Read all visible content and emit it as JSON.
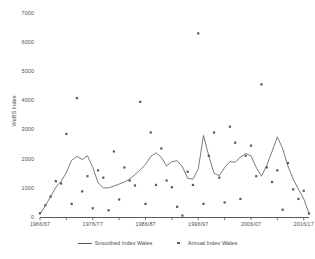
{
  "chart_data": {
    "type": "line",
    "title": "",
    "xlabel": "",
    "ylabel": "WeBS Index",
    "ylim": [
      0,
      7000
    ],
    "grid": false,
    "legend_position": "bottom",
    "y_ticks": [
      "0",
      "1000",
      "2000",
      "3000",
      "4000",
      "5000",
      "6000",
      "7000"
    ],
    "y_tick_values": [
      0,
      1000,
      2000,
      3000,
      4000,
      5000,
      6000,
      7000
    ],
    "x_ticks": [
      "1966/67",
      "1976/77",
      "1986/87",
      "1996/97",
      "2006/07",
      "2016/17"
    ],
    "x_tick_values": [
      1966,
      1976,
      1986,
      1996,
      2006,
      2016
    ],
    "x_range": [
      1966,
      2017
    ],
    "series": [
      {
        "name": "Smoothed Index Wales",
        "type": "line",
        "x": [
          1966,
          1967,
          1968,
          1969,
          1970,
          1971,
          1972,
          1973,
          1974,
          1975,
          1976,
          1977,
          1978,
          1979,
          1980,
          1981,
          1982,
          1983,
          1984,
          1985,
          1986,
          1987,
          1988,
          1989,
          1990,
          1991,
          1992,
          1993,
          1994,
          1995,
          1996,
          1997,
          1998,
          1999,
          2000,
          2001,
          2002,
          2003,
          2004,
          2005,
          2006,
          2007,
          2008,
          2009,
          2010,
          2011,
          2012,
          2013,
          2014,
          2015,
          2016,
          2017
        ],
        "values": [
          100,
          380,
          700,
          1020,
          1230,
          1520,
          1950,
          2080,
          1970,
          2100,
          1700,
          1180,
          1000,
          1000,
          1060,
          1130,
          1200,
          1300,
          1450,
          1620,
          1800,
          2080,
          2200,
          2050,
          1750,
          1900,
          1930,
          1720,
          1330,
          1300,
          1650,
          2800,
          2100,
          1500,
          1420,
          1700,
          1900,
          1880,
          2050,
          2180,
          2100,
          1700,
          1400,
          1780,
          2250,
          2750,
          2350,
          1750,
          1300,
          950,
          620,
          120
        ]
      },
      {
        "name": "Annual Index Wales",
        "type": "scatter",
        "x": [
          1966,
          1967,
          1968,
          1969,
          1970,
          1971,
          1972,
          1973,
          1974,
          1975,
          1976,
          1977,
          1978,
          1979,
          1980,
          1981,
          1982,
          1983,
          1984,
          1985,
          1986,
          1987,
          1988,
          1989,
          1990,
          1991,
          1992,
          1993,
          1994,
          1995,
          1996,
          1997,
          1998,
          1999,
          2000,
          2001,
          2002,
          2003,
          2004,
          2005,
          2006,
          2007,
          2008,
          2009,
          2010,
          2011,
          2012,
          2013,
          2014,
          2015,
          2016,
          2017
        ],
        "values": [
          130,
          400,
          700,
          1230,
          1150,
          2850,
          450,
          4080,
          880,
          1400,
          300,
          1600,
          1350,
          230,
          2250,
          600,
          1700,
          1250,
          1080,
          3950,
          450,
          2900,
          1100,
          2350,
          1250,
          1020,
          350,
          50,
          1550,
          1100,
          6300,
          450,
          2100,
          2900,
          1350,
          500,
          3100,
          2550,
          620,
          2100,
          2450,
          1400,
          4550,
          1700,
          1200,
          1600,
          250,
          1850,
          950,
          620,
          900,
          120
        ]
      }
    ]
  },
  "legend": {
    "items": [
      {
        "label": "Smoothed Index Wales",
        "marker": "line"
      },
      {
        "label": "Annual Index Wales",
        "marker": "dot"
      }
    ]
  },
  "colors": {
    "line": "#595959",
    "marker": "#595959",
    "axis": "#595959",
    "text": "#4a4a4a",
    "background": "#ffffff"
  }
}
